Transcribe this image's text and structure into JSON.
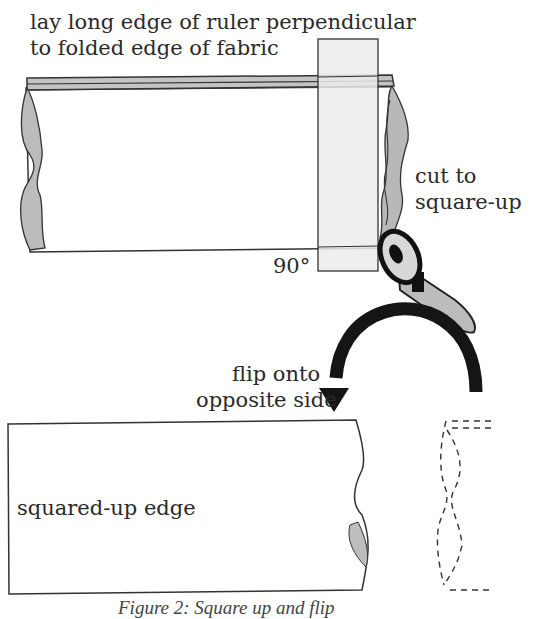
{
  "labels": {
    "instruction_line1": "lay long edge of ruler perpendicular",
    "instruction_line2": "to folded edge of fabric",
    "cut_line1": "cut to",
    "cut_line2": "square-up",
    "angle": "90°",
    "flip_line1": "flip onto",
    "flip_line2": "opposite side",
    "squared_edge": "squared-up edge",
    "caption": "Figure 2: Square up and flip"
  },
  "colors": {
    "fabric_fill": "#ffffff",
    "selvage_fill": "#bdbdbd",
    "frayed_fill": "#b8b8b8",
    "ruler_fill": "#efefef",
    "outline": "#333333",
    "arrow": "#1a1a1a",
    "cutter_blade": "#d9d9d9",
    "cutter_handle": "#bcbcbc"
  }
}
